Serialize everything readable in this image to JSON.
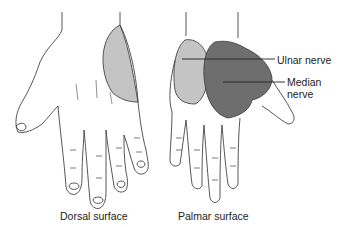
{
  "figure": {
    "left_hand": {
      "caption": "Dorsal surface",
      "ulnar_region_color": "#c4c4c4"
    },
    "right_hand": {
      "caption": "Palmar surface",
      "ulnar_region_color": "#c4c4c4",
      "median_region_color": "#6e6e6e"
    },
    "labels": {
      "ulnar": "Ulnar nerve",
      "median_line1": "Median",
      "median_line2": "nerve"
    },
    "outline_color": "#444444"
  }
}
